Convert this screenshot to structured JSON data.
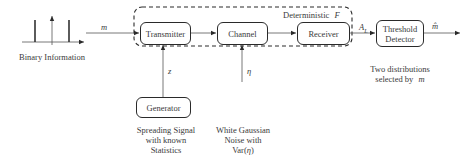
{
  "diagram": {
    "input": {
      "label": "Binary Information",
      "signal_symbol": "m"
    },
    "deterministic_region": {
      "label_prefix": "Deterministic",
      "label_symbol": "F"
    },
    "blocks": {
      "transmitter": "Transmitter",
      "channel": "Channel",
      "receiver": "Receiver",
      "threshold_detector_line1": "Threshold",
      "threshold_detector_line2": "Detector",
      "generator": "Generator"
    },
    "signals": {
      "spreading": "z",
      "noise": "η",
      "receiver_output_main": "A",
      "receiver_output_sub": "L",
      "detector_output": "m̂"
    },
    "annotations": {
      "generator_desc": [
        "Spreading Signal",
        "with known",
        "Statistics"
      ],
      "noise_desc_line1": "White Gaussian",
      "noise_desc_line2": "Noise with",
      "noise_desc_line3_prefix": "Var(",
      "noise_desc_line3_symbol": "η",
      "noise_desc_line3_suffix": ")",
      "detector_desc_line1": "Two distributions",
      "detector_desc_line2_prefix": "selected by",
      "detector_desc_line2_symbol": "m"
    },
    "colors": {
      "stroke": "#2a2a2a",
      "text": "#3a3a3a",
      "background": "#ffffff"
    }
  }
}
